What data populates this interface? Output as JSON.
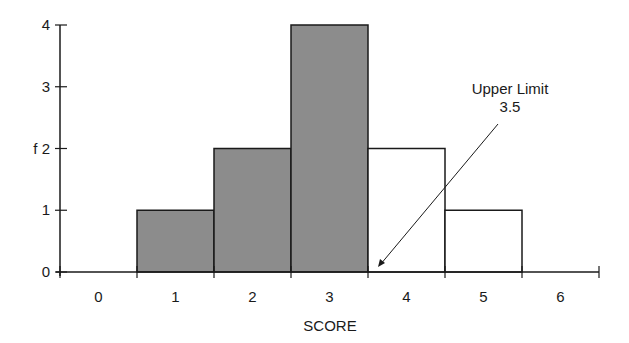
{
  "chart_data": {
    "type": "bar",
    "subtype": "histogram",
    "title": "",
    "xlabel": "SCORE",
    "ylabel": "f",
    "categories": [
      "0",
      "1",
      "2",
      "3",
      "4",
      "5",
      "6"
    ],
    "values": [
      0,
      1,
      2,
      4,
      2,
      1,
      0
    ],
    "bin_edges": [
      -0.5,
      0.5,
      1.5,
      2.5,
      3.5,
      4.5,
      5.5,
      6.5
    ],
    "shaded_bins": [
      false,
      true,
      true,
      true,
      false,
      false,
      false
    ],
    "ylim": [
      0,
      4
    ],
    "yticks": [
      "0",
      "1",
      "f 2",
      "3",
      "4"
    ],
    "grid": false,
    "legend": null,
    "annotations": [
      {
        "text_line1": "Upper Limit",
        "text_line2": "3.5",
        "points_to_x": 3.5
      }
    ]
  },
  "colors": {
    "shaded_fill": "#8c8c8c",
    "unshaded_fill": "#ffffff",
    "stroke": "#1a1a1a"
  }
}
